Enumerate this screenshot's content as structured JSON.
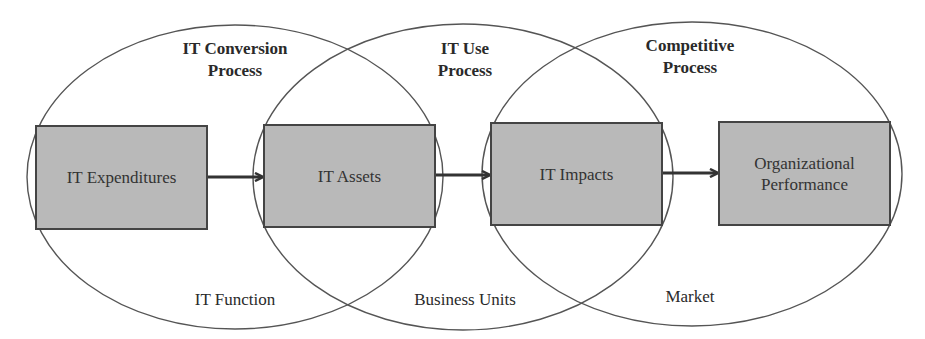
{
  "diagram": {
    "processes": [
      {
        "title_line1": "IT Conversion",
        "title_line2": "Process",
        "context": "IT Function"
      },
      {
        "title_line1": "IT Use",
        "title_line2": "Process",
        "context": "Business Units"
      },
      {
        "title_line1": "Competitive",
        "title_line2": "Process",
        "context": "Market"
      }
    ],
    "boxes": [
      {
        "label": "IT Expenditures"
      },
      {
        "label": "IT Assets"
      },
      {
        "label": "IT Impacts"
      },
      {
        "label_line1": "Organizational",
        "label_line2": "Performance"
      }
    ],
    "colors": {
      "box_fill": "#b9b9b9",
      "line": "#444444",
      "text": "#2a2a2a"
    }
  }
}
